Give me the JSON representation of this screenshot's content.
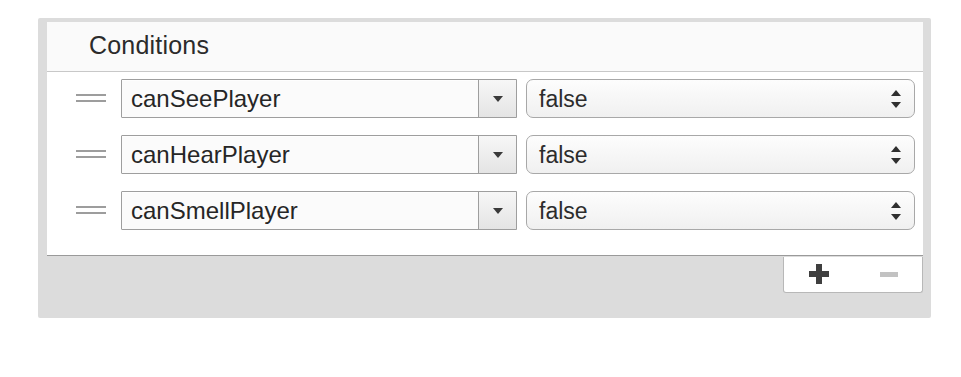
{
  "panel": {
    "title": "Conditions",
    "background_color": "#dcdcdc",
    "content_background_color": "#ffffff"
  },
  "rows": [
    {
      "drag_handle_name": "drag-handle",
      "property": "canSeePlayer",
      "property_dropdown_icon": "chevron-down-icon",
      "value": "false",
      "value_dropdown_icon": "updown-arrows-icon"
    },
    {
      "drag_handle_name": "drag-handle",
      "property": "canHearPlayer",
      "property_dropdown_icon": "chevron-down-icon",
      "value": "false",
      "value_dropdown_icon": "updown-arrows-icon"
    },
    {
      "drag_handle_name": "drag-handle",
      "property": "canSmellPlayer",
      "property_dropdown_icon": "chevron-down-icon",
      "value": "false",
      "value_dropdown_icon": "updown-arrows-icon"
    }
  ],
  "toolbar": {
    "add_icon": "plus-icon",
    "add_label": "+",
    "add_enabled": true,
    "remove_icon": "minus-icon",
    "remove_label": "−",
    "remove_enabled": false
  }
}
